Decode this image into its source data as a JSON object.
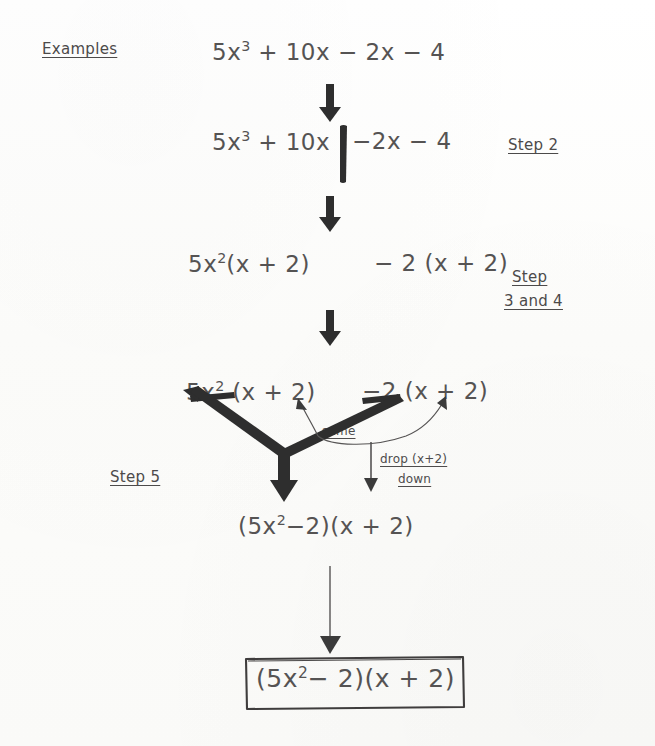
{
  "document": {
    "kind": "handwritten-algebra-notes",
    "topic": "factoring-by-grouping",
    "background_color": "#fdfdfc",
    "ink_color": "#4a4a4a"
  },
  "header": {
    "title": "Examples"
  },
  "steps": [
    {
      "id": "line-1",
      "name": "original-expression",
      "text": "5x3 + 10x − 2x − 4",
      "parts": {
        "coef1": "5x",
        "exp1": "3",
        "rest": " + 10x − 2x − 4"
      }
    },
    {
      "id": "line-2",
      "name": "grouped-expression",
      "left": "5x",
      "left_exp": "3",
      "left_rest": " + 10x",
      "right": "−2x − 4",
      "divider": "vertical-bar"
    },
    {
      "id": "line-3",
      "name": "factored-groups",
      "left": "5x",
      "left_exp": "2",
      "left_rest": "(x + 2)",
      "right": "− 2 (x + 2)"
    },
    {
      "id": "line-4",
      "name": "common-factor-identification",
      "left": "5x",
      "left_exp": "2",
      "left_rest": " (x + 2)",
      "right": "−2 (x + 2)"
    },
    {
      "id": "line-5",
      "name": "combined-factors",
      "text": "(5x2−2)(x + 2)",
      "parts": {
        "a": "(5x",
        "exp": "2",
        "b": "−2)(x + 2)"
      }
    },
    {
      "id": "line-6",
      "name": "final-answer-boxed",
      "parts": {
        "a": "(5x",
        "exp": "2",
        "b": "− 2)(x + 2)"
      }
    }
  ],
  "side_labels": [
    {
      "name": "step-2-label",
      "text": "Step 2"
    },
    {
      "name": "step-3-4-label-line1",
      "text": "Step"
    },
    {
      "name": "step-3-4-label-line2",
      "text": "3 and 4"
    },
    {
      "name": "step-5-label",
      "text": "Step 5"
    }
  ],
  "annotations": [
    {
      "name": "same-annotation",
      "text": "same"
    },
    {
      "name": "drop-annotation-line1",
      "text": "drop (x+2)"
    },
    {
      "name": "drop-annotation-line2",
      "text": "down"
    }
  ],
  "arrows": [
    {
      "name": "arrow-line1-to-line2",
      "style": "thick-down"
    },
    {
      "name": "arrow-line2-to-line3",
      "style": "thick-down"
    },
    {
      "name": "arrow-line3-to-line4",
      "style": "thick-down"
    },
    {
      "name": "arrow-merge-v-left",
      "style": "thick-diagonal"
    },
    {
      "name": "arrow-merge-v-right",
      "style": "thick-diagonal"
    },
    {
      "name": "arrow-merge-down",
      "style": "thick-down"
    },
    {
      "name": "arrow-same-curve-left",
      "style": "thin-curve"
    },
    {
      "name": "arrow-same-curve-right",
      "style": "thin-curve"
    },
    {
      "name": "arrow-drop-down",
      "style": "thin-down"
    },
    {
      "name": "arrow-line5-to-box",
      "style": "thin-long-down"
    }
  ]
}
